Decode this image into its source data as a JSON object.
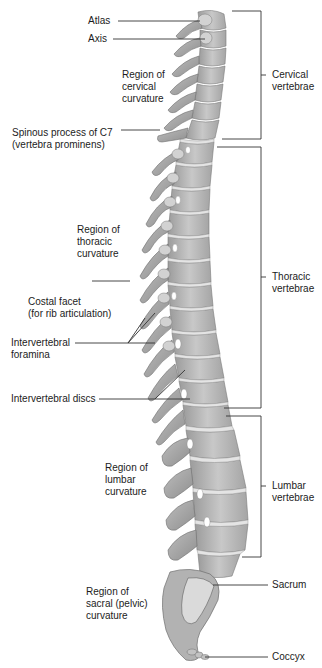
{
  "figure": {
    "colors": {
      "bone_fill": "#b9b9b9",
      "bone_dark": "#8a8a8a",
      "bone_light": "#dcdcdc",
      "disc": "#e6e6e6",
      "leader": "#333333",
      "background": "#ffffff"
    }
  },
  "left_labels": {
    "atlas": "Atlas",
    "axis": "Axis",
    "cervical_curvature": "Region of\ncervical\ncurvature",
    "spinous_c7": "Spinous process of C7\n(vertebra prominens)",
    "thoracic_curvature": "Region of\nthoracic\ncurvature",
    "costal_facet": "Costal facet\n(for rib articulation)",
    "intervertebral_foramina": "Intervertebral\nforamina",
    "intervertebral_discs": "Intervertebral discs",
    "lumbar_curvature": "Region of\nlumbar\ncurvature",
    "sacral_curvature": "Region of\nsacral (pelvic)\ncurvature"
  },
  "right_labels": {
    "cervical": "Cervical\nvertebrae",
    "thoracic": "Thoracic\nvertebrae",
    "lumbar": "Lumbar\nvertebrae",
    "sacrum": "Sacrum",
    "coccyx": "Coccyx"
  }
}
